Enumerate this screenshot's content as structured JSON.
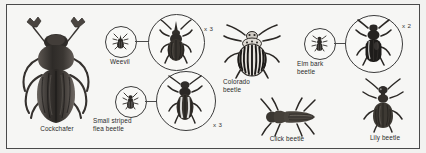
{
  "plate": {
    "title": "Beetle identification plate",
    "background_color": "#f6f6f4",
    "frame_color": "#4a4a4a",
    "ink_color": "#2b2b2b"
  },
  "specimens": [
    {
      "id": "cockchafer",
      "label": "Cockchafer",
      "magnification": "",
      "has_inset_circle": false,
      "view": "dorsal",
      "size_class": "large"
    },
    {
      "id": "weevil",
      "label": "Weevil",
      "magnification": "x 3",
      "has_inset_circle": true,
      "view": "dorsal",
      "size_class": "small"
    },
    {
      "id": "small-striped-flea-beetle",
      "label": "Small striped\nflea beetle",
      "magnification": "x 3",
      "has_inset_circle": true,
      "view": "dorsal",
      "size_class": "small"
    },
    {
      "id": "colorado-beetle",
      "label": "Colorado\nbeetle",
      "magnification": "",
      "has_inset_circle": false,
      "view": "dorsal",
      "size_class": "medium"
    },
    {
      "id": "elm-bark-beetle",
      "label": "Elm bark\nbeetle",
      "magnification": "x 2",
      "has_inset_circle": true,
      "view": "dorsal",
      "size_class": "small"
    },
    {
      "id": "click-beetle",
      "label": "Click beetle",
      "magnification": "",
      "has_inset_circle": false,
      "view": "dorsal",
      "size_class": "medium"
    },
    {
      "id": "lily-beetle",
      "label": "Lily beetle",
      "magnification": "",
      "has_inset_circle": false,
      "view": "dorsal",
      "size_class": "medium"
    }
  ]
}
